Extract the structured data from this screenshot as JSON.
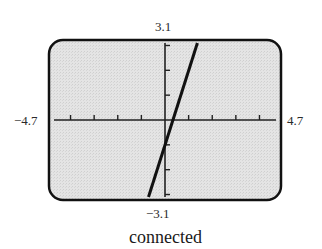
{
  "chart_data": {
    "type": "line",
    "title": "",
    "caption": "connected",
    "function": "y = 3x - 1",
    "series": [
      {
        "name": "y = 3x - 1",
        "x": [
          -0.7,
          1.37
        ],
        "y": [
          -3.1,
          3.1
        ]
      }
    ],
    "xlim": [
      -4.7,
      4.7
    ],
    "ylim": [
      -3.1,
      3.1
    ],
    "xscale": 1,
    "yscale": 1,
    "x_tick_labels": {
      "min": "−4.7",
      "max": "4.7"
    },
    "y_tick_labels": {
      "min": "−3.1",
      "max": "3.1"
    },
    "x_ticks": [
      -4,
      -3,
      -2,
      -1,
      1,
      2,
      3,
      4
    ],
    "y_ticks": [
      -3,
      -2,
      -1,
      1,
      2,
      3
    ],
    "grid": false,
    "legend": null,
    "mode": "connected"
  },
  "colors": {
    "screen_bg": "#e0e0e0",
    "frame": "#111111",
    "axis": "#222222",
    "line": "#111111"
  },
  "labels": {
    "ymax": "3.1",
    "ymin": "−3.1",
    "xmin": "−4.7",
    "xmax": "4.7",
    "caption": "connected"
  }
}
